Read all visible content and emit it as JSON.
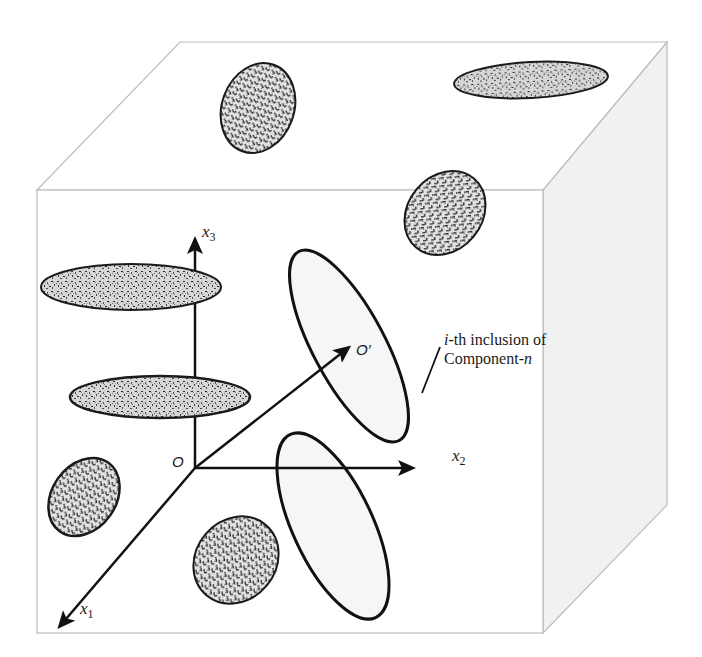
{
  "figure": {
    "colors": {
      "cube_edge": "#b8b8b8",
      "side_face_fill": "#f1f1f1",
      "axis": "#111111",
      "inclusion_outline": "#1a1a1a",
      "inclusion_texture_dark": "#2a2a2a",
      "inclusion_texture_light": "#d9d9d9",
      "highlighted_inclusion_fill": "#f4f4f4"
    },
    "axes": {
      "origin_label": "O",
      "x1_label": "x",
      "x1_sub": "1",
      "x2_label": "x",
      "x2_sub": "2",
      "x3_label": "x",
      "x3_sub": "3",
      "local_origin_label": "O′"
    },
    "annotation": {
      "line1_italic": "i",
      "line1_rest": "-th inclusion of",
      "line2_rest": "Component-",
      "line2_italic": "n"
    },
    "inclusions": [
      {
        "id": "top-face-left",
        "type": "speckled"
      },
      {
        "id": "top-face-right",
        "type": "speckled"
      },
      {
        "id": "front-upper-right",
        "type": "hatched"
      },
      {
        "id": "x3-upper-flat",
        "type": "speckled"
      },
      {
        "id": "x3-lower-flat",
        "type": "speckled"
      },
      {
        "id": "front-left-lower",
        "type": "hatched"
      },
      {
        "id": "front-bottom-center",
        "type": "hatched"
      },
      {
        "id": "ith-inclusion-upper",
        "type": "outlined"
      },
      {
        "id": "ith-inclusion-lower",
        "type": "outlined"
      }
    ]
  }
}
